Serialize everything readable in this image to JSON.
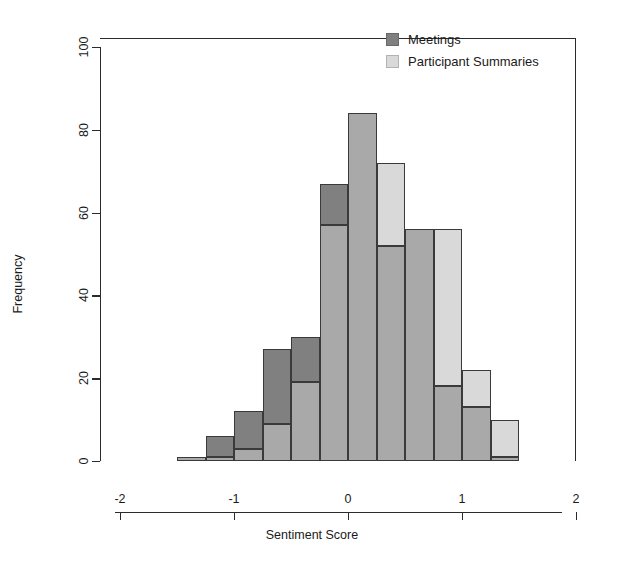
{
  "chart_data": {
    "type": "bar",
    "subtype": "overlapping-histogram",
    "title": "",
    "xlabel": "Sentiment Score",
    "ylabel": "Frequency",
    "xlim": [
      -2.35,
      2.3
    ],
    "ylim": [
      0,
      104
    ],
    "grid": false,
    "xticks": [
      -2,
      -1,
      0,
      1,
      2
    ],
    "xtick_labels": [
      "-2",
      "-1",
      "0",
      "1",
      "2"
    ],
    "yticks": [
      0,
      20,
      40,
      60,
      80,
      100
    ],
    "ytick_labels": [
      "0",
      "20",
      "40",
      "60",
      "80",
      "100"
    ],
    "bin_width": 0.25,
    "bin_edges": [
      -1.5,
      -1.25,
      -1.0,
      -0.75,
      -0.5,
      -0.25,
      0.0,
      0.25,
      0.5,
      0.75,
      1.0,
      1.25,
      1.5
    ],
    "bin_centers": [
      -1.375,
      -1.125,
      -0.875,
      -0.625,
      -0.375,
      -0.125,
      0.125,
      0.375,
      0.625,
      0.875,
      1.125,
      1.375
    ],
    "legend_position": "top-right",
    "series": [
      {
        "name": "Meetings",
        "color": "#808080",
        "values": [
          1,
          6,
          12,
          27,
          30,
          67,
          84,
          52,
          56,
          18,
          13,
          1
        ]
      },
      {
        "name": "Participant Summaries",
        "color": "#d9d9d9",
        "values": [
          1,
          1,
          3,
          9,
          19,
          57,
          84,
          72,
          56,
          56,
          22,
          10
        ]
      }
    ],
    "overlap_color": "#a9a9a9",
    "bar_border_color": "#3a3a3a"
  },
  "legend": {
    "items": [
      {
        "label": "Meetings",
        "swatch": "#808080"
      },
      {
        "label": "Participant Summaries",
        "swatch": "#d9d9d9"
      }
    ]
  },
  "axes": {
    "x_title": "Sentiment Score",
    "y_title": "Frequency"
  }
}
